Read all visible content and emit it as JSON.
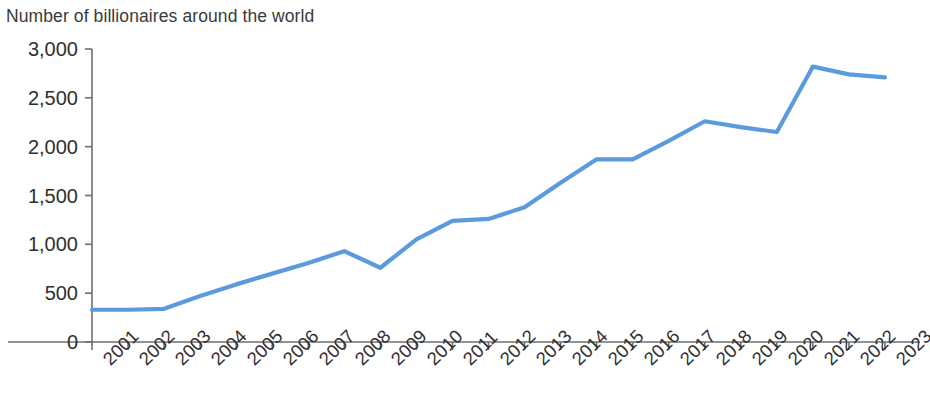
{
  "chart_data": {
    "type": "line",
    "title": "Number of billionaires around the world",
    "xlabel": "",
    "ylabel": "",
    "x": [
      2001,
      2002,
      2003,
      2004,
      2005,
      2006,
      2007,
      2008,
      2009,
      2010,
      2011,
      2012,
      2013,
      2014,
      2015,
      2016,
      2017,
      2018,
      2019,
      2020,
      2021,
      2022,
      2023
    ],
    "categories": [
      "2001",
      "2002",
      "2003",
      "2004",
      "2005",
      "2006",
      "2007",
      "2008",
      "2009",
      "2010",
      "2011",
      "2012",
      "2013",
      "2014",
      "2015",
      "2016",
      "2017",
      "2018",
      "2019",
      "2020",
      "2021",
      "2022",
      "2023"
    ],
    "values": [
      330,
      330,
      340,
      470,
      590,
      700,
      810,
      930,
      760,
      1050,
      1240,
      1260,
      1380,
      1630,
      1870,
      1870,
      2060,
      2260,
      2200,
      2150,
      2820,
      2740,
      2710
    ],
    "series": [
      {
        "name": "Number of billionaires",
        "values": [
          330,
          330,
          340,
          470,
          590,
          700,
          810,
          930,
          760,
          1050,
          1240,
          1260,
          1380,
          1630,
          1870,
          1870,
          2060,
          2260,
          2200,
          2150,
          2820,
          2740,
          2710
        ],
        "color": "#5b9bdd"
      }
    ],
    "ylim": [
      0,
      3000
    ],
    "yticks": [
      0,
      500,
      1000,
      1500,
      2000,
      2500,
      3000
    ],
    "ytick_labels": [
      "0",
      "500",
      "1,000",
      "1,500",
      "2,000",
      "2,500",
      "3,000"
    ],
    "grid": false,
    "legend": false,
    "legend_position": "none",
    "line_color": "#5b9bdd",
    "axis_color": "#6f6f6f",
    "text_color": "#2f2f2f",
    "xtick_rotation": -45
  }
}
